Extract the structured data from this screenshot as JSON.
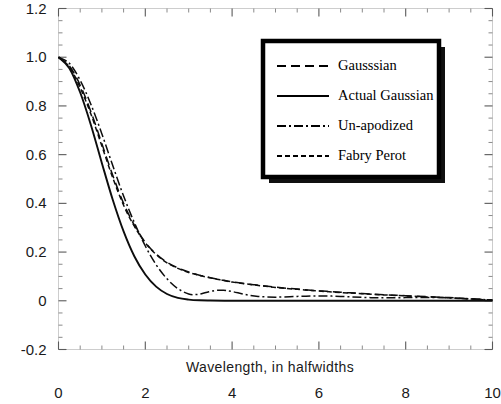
{
  "chart_data": {
    "type": "line",
    "title": "",
    "xlabel": "Wavelength, in halfwidths",
    "ylabel": "",
    "xlim": [
      0,
      10
    ],
    "ylim": [
      -0.2,
      1.2
    ],
    "xticks": [
      0,
      2,
      4,
      6,
      8,
      10
    ],
    "xtick_labels": [
      "0",
      "2",
      "4",
      "6",
      "8",
      "10"
    ],
    "yticks": [
      -0.2,
      0,
      0.2,
      0.4,
      0.6,
      0.8,
      1.0,
      1.2
    ],
    "ytick_labels": [
      "-0.2",
      "0",
      "0.2",
      "0.4",
      "0.6",
      "0.8",
      "1.0",
      "1.2"
    ],
    "grid": false,
    "minor_ticks": true,
    "legend_position": "upper-right",
    "series": [
      {
        "name": "Gausssian",
        "style": "dashed",
        "x": [
          0,
          0.25,
          0.5,
          0.75,
          1.0,
          1.25,
          1.5,
          1.75,
          2.0,
          2.25,
          2.5,
          2.75,
          3.0,
          3.25,
          3.5,
          3.75,
          4.0,
          4.5,
          5.0,
          5.5,
          6.0,
          6.5,
          7.0,
          7.5,
          8.0,
          8.5,
          9.0,
          9.5,
          10.0
        ],
        "y": [
          1.0,
          0.965,
          0.885,
          0.775,
          0.645,
          0.515,
          0.4,
          0.31,
          0.24,
          0.192,
          0.158,
          0.135,
          0.118,
          0.105,
          0.095,
          0.086,
          0.078,
          0.066,
          0.056,
          0.048,
          0.041,
          0.035,
          0.03,
          0.025,
          0.021,
          0.017,
          0.013,
          0.008,
          0.003
        ]
      },
      {
        "name": "Actual Gaussian",
        "style": "solid",
        "x": [
          0,
          0.25,
          0.5,
          0.75,
          1.0,
          1.25,
          1.5,
          1.75,
          2.0,
          2.25,
          2.5,
          2.75,
          3.0,
          3.25,
          3.5,
          4.0,
          4.5,
          5.0,
          6.0,
          7.0,
          8.0,
          9.0,
          10.0
        ],
        "y": [
          1.0,
          0.955,
          0.855,
          0.72,
          0.565,
          0.415,
          0.285,
          0.182,
          0.108,
          0.058,
          0.028,
          0.012,
          0.005,
          0.002,
          0.001,
          0.0,
          0.0,
          0.0,
          0.0,
          0.0,
          0.0,
          0.0,
          0.0
        ]
      },
      {
        "name": "Un-apodized",
        "style": "dashdot",
        "x": [
          0,
          0.25,
          0.5,
          0.75,
          1.0,
          1.25,
          1.5,
          1.75,
          2.0,
          2.25,
          2.5,
          2.75,
          3.0,
          3.2,
          3.4,
          3.6,
          3.8,
          4.0,
          4.3,
          4.6,
          5.0,
          5.5,
          6.0,
          6.5,
          7.0,
          7.5,
          8.0,
          8.5,
          9.0,
          9.5,
          10.0
        ],
        "y": [
          1.0,
          0.975,
          0.905,
          0.805,
          0.685,
          0.555,
          0.43,
          0.32,
          0.225,
          0.148,
          0.09,
          0.05,
          0.028,
          0.026,
          0.034,
          0.042,
          0.043,
          0.038,
          0.026,
          0.018,
          0.015,
          0.018,
          0.02,
          0.018,
          0.014,
          0.012,
          0.013,
          0.014,
          0.012,
          0.008,
          0.003
        ]
      },
      {
        "name": "Fabry Perot",
        "style": "dotted-dash",
        "x": [
          0,
          0.25,
          0.5,
          0.75,
          1.0,
          1.25,
          1.5,
          1.75,
          2.0,
          2.25,
          2.5,
          2.75,
          3.0,
          3.25,
          3.5,
          3.75,
          4.0,
          4.5,
          5.0,
          5.5,
          6.0,
          6.5,
          7.0,
          7.5,
          8.0,
          8.5,
          9.0,
          9.5,
          10.0
        ],
        "y": [
          1.0,
          0.96,
          0.875,
          0.765,
          0.635,
          0.505,
          0.392,
          0.305,
          0.238,
          0.19,
          0.156,
          0.133,
          0.116,
          0.104,
          0.094,
          0.085,
          0.077,
          0.065,
          0.055,
          0.047,
          0.04,
          0.034,
          0.029,
          0.024,
          0.02,
          0.016,
          0.012,
          0.007,
          0.002
        ]
      }
    ]
  },
  "legend": {
    "entries": [
      {
        "label": "Gausssian",
        "style": "dashed"
      },
      {
        "label": "Actual Gaussian",
        "style": "solid"
      },
      {
        "label": "Un-apodized",
        "style": "dashdot"
      },
      {
        "label": "Fabry Perot",
        "style": "dotted-dash"
      }
    ]
  },
  "colors": {
    "curve": "#0d0d0d",
    "frame": "#9a9a9a",
    "text": "#1a1a1a",
    "background": "#ffffff"
  }
}
